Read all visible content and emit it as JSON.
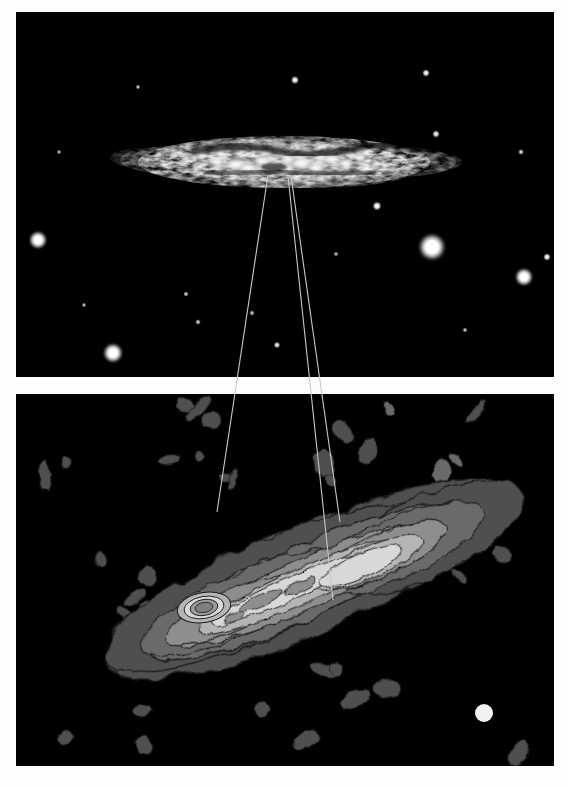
{
  "figure": {
    "object_name": "M82",
    "panels": [
      {
        "id": "optical",
        "label": "optical-image-panel",
        "description": "Optical greyscale image of edge-on starburst galaxy M82 with field stars",
        "bbox": [
          16,
          12,
          538,
          365
        ],
        "background": "#000000"
      },
      {
        "id": "radio-contour",
        "label": "radio-contour-map-panel",
        "description": "Radio continuum contour map of M82 with filled greyscale contour levels and beam size marker",
        "bbox": [
          16,
          394,
          538,
          372
        ],
        "background": "#000000"
      }
    ],
    "pointer_lines": [
      {
        "name": "pointer-line-1",
        "from": [
          268,
          175
        ],
        "to": [
          217,
          512
        ],
        "color": "#c8c8c8"
      },
      {
        "name": "pointer-line-2",
        "from": [
          288,
          176
        ],
        "to": [
          333,
          600
        ],
        "color": "#c8c8c8"
      },
      {
        "name": "pointer-line-3",
        "from": [
          291,
          176
        ],
        "to": [
          340,
          522
        ],
        "color": "#c8c8c8"
      }
    ],
    "beam_marker": {
      "name": "beam-size-marker",
      "cx": 484,
      "cy": 713,
      "r": 9,
      "color": "#f2f2f2"
    },
    "contour_palette": {
      "level_0_background": "#000000",
      "level_1": "#4f4f4f",
      "level_2": "#6b6b6b",
      "level_3": "#8e8e8e",
      "level_4": "#b5b5b5",
      "level_5": "#d8d8d8",
      "level_6": "#efefef",
      "level_7_peak": "#ffffff",
      "contour_line": "#1c1c1c"
    },
    "optical_palette": {
      "sky": "#000000",
      "disk_faint": "#4a4a4a",
      "disk_mid": "#9a9a9a",
      "disk_bright": "#d8d8d8",
      "knots": "#ffffff",
      "dust_lane": "#141414",
      "star": "#ffffff"
    },
    "stars": [
      {
        "name": "star-bright-1",
        "cx": 432,
        "cy": 247,
        "r": 7.5,
        "brightness": 1.0
      },
      {
        "name": "star-bright-2",
        "cx": 524,
        "cy": 277,
        "r": 5.0,
        "brightness": 0.95
      },
      {
        "name": "star-bright-3",
        "cx": 38,
        "cy": 240,
        "r": 5.0,
        "brightness": 0.95
      },
      {
        "name": "star-bright-4",
        "cx": 113,
        "cy": 353,
        "r": 5.5,
        "brightness": 0.95
      },
      {
        "name": "star-faint-1",
        "cx": 295,
        "cy": 80,
        "r": 2.2,
        "brightness": 0.8
      },
      {
        "name": "star-faint-2",
        "cx": 426,
        "cy": 73,
        "r": 2.0,
        "brightness": 0.8
      },
      {
        "name": "star-faint-3",
        "cx": 436,
        "cy": 134,
        "r": 2.0,
        "brightness": 0.75
      },
      {
        "name": "star-faint-4",
        "cx": 377,
        "cy": 206,
        "r": 2.4,
        "brightness": 0.85
      },
      {
        "name": "star-faint-5",
        "cx": 547,
        "cy": 257,
        "r": 2.0,
        "brightness": 0.8
      },
      {
        "name": "star-faint-6",
        "cx": 471,
        "cy": 384,
        "r": 2.0,
        "brightness": 0.8
      },
      {
        "name": "star-faint-7",
        "cx": 277,
        "cy": 345,
        "r": 1.8,
        "brightness": 0.7
      },
      {
        "name": "star-faint-8",
        "cx": 198,
        "cy": 322,
        "r": 1.5,
        "brightness": 0.6
      },
      {
        "name": "star-faint-9",
        "cx": 186,
        "cy": 294,
        "r": 1.4,
        "brightness": 0.6
      },
      {
        "name": "star-faint-10",
        "cx": 138,
        "cy": 87,
        "r": 1.3,
        "brightness": 0.55
      },
      {
        "name": "star-faint-11",
        "cx": 521,
        "cy": 152,
        "r": 1.6,
        "brightness": 0.6
      },
      {
        "name": "star-faint-12",
        "cx": 59,
        "cy": 152,
        "r": 1.3,
        "brightness": 0.5
      },
      {
        "name": "star-faint-13",
        "cx": 465,
        "cy": 330,
        "r": 1.4,
        "brightness": 0.55
      },
      {
        "name": "star-faint-14",
        "cx": 252,
        "cy": 313,
        "r": 1.5,
        "brightness": 0.55
      },
      {
        "name": "star-faint-15",
        "cx": 336,
        "cy": 254,
        "r": 1.4,
        "brightness": 0.5
      },
      {
        "name": "star-faint-16",
        "cx": 84,
        "cy": 305,
        "r": 1.3,
        "brightness": 0.5
      }
    ],
    "galaxy_optical": {
      "name": "m82-optical-disk",
      "center": [
        284,
        162
      ],
      "major_axis_px": 290,
      "minor_axis_px": 54,
      "position_angle_deg": -4,
      "bright_knots": [
        [
          236,
          165
        ],
        [
          248,
          170
        ],
        [
          262,
          164
        ],
        [
          288,
          160
        ],
        [
          300,
          167
        ],
        [
          312,
          158
        ],
        [
          325,
          165
        ],
        [
          340,
          160
        ],
        [
          218,
          158
        ],
        [
          352,
          168
        ],
        [
          272,
          157
        ],
        [
          206,
          167
        ],
        [
          364,
          156
        ]
      ]
    },
    "radio_map": {
      "name": "m82-radio-contours",
      "major_axis_center": [
        310,
        580
      ],
      "position_angle_deg": -24,
      "peak_marker": [
        333,
        598
      ],
      "secondary_peak": [
        200,
        545
      ],
      "noise_blob_count": 44
    }
  }
}
